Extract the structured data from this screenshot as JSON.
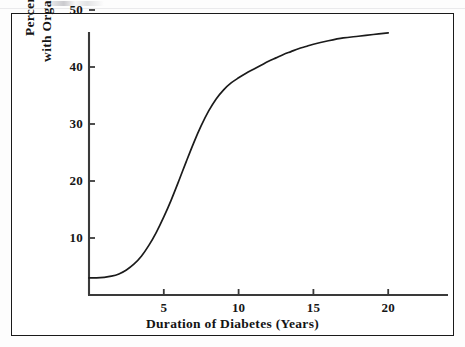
{
  "figure": {
    "background_color": "#ffffff",
    "frame_color": "#1a1a1a",
    "axis_color": "#3a3a3a",
    "curve_color": "#1b1b1b"
  },
  "chart_data": {
    "type": "line",
    "title": "",
    "subtitle": "",
    "xlabel": "Duration of Diabetes (Years)",
    "ylabel_line1": "Percent of Patients",
    "ylabel_line2": "with Orgasmic Dysfunction",
    "ylabel": "Percent of Patients with Orgasmic Dysfunction",
    "xlim": [
      0,
      23.5
    ],
    "ylim": [
      0,
      50
    ],
    "xticks": [
      5,
      10,
      15,
      20
    ],
    "xtick_labels": [
      "5",
      "10",
      "15",
      "20"
    ],
    "yticks": [
      10,
      20,
      30,
      40,
      50
    ],
    "ytick_labels": [
      "10",
      "20",
      "30",
      "40",
      "50"
    ],
    "grid": false,
    "legend": false,
    "legend_position": "none",
    "tick_direction": "in",
    "annotations": [],
    "series": [
      {
        "name": "Orgasmic dysfunction prevalence",
        "x": [
          0.0,
          0.5,
          1.0,
          1.5,
          2.0,
          2.5,
          3.0,
          3.5,
          4.0,
          4.5,
          5.0,
          5.5,
          6.0,
          6.5,
          7.0,
          7.5,
          8.0,
          8.5,
          9.0,
          9.5,
          10.0,
          10.5,
          11.0,
          11.5,
          12.0,
          12.5,
          13.0,
          13.5,
          14.0,
          14.5,
          15.0,
          16.0,
          17.0,
          18.0,
          19.0,
          20.0
        ],
        "values": [
          3.0,
          3.0,
          3.1,
          3.3,
          3.7,
          4.4,
          5.4,
          6.8,
          8.7,
          11.0,
          13.7,
          16.7,
          20.0,
          23.4,
          26.7,
          29.7,
          32.3,
          34.4,
          36.0,
          37.2,
          38.1,
          38.9,
          39.6,
          40.3,
          41.0,
          41.6,
          42.2,
          42.7,
          43.2,
          43.6,
          44.0,
          44.6,
          45.1,
          45.4,
          45.7,
          46.0
        ]
      }
    ]
  }
}
